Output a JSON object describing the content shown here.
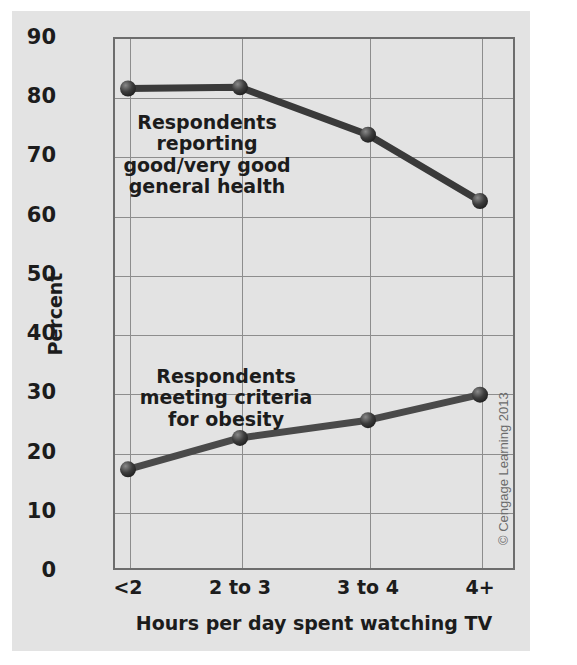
{
  "chart_data": {
    "type": "line",
    "title": "",
    "xlabel": "Hours per day spent watching TV",
    "ylabel": "Percent",
    "categories": [
      "<2",
      "2 to 3",
      "3 to 4",
      "4+"
    ],
    "ylim": [
      0,
      90
    ],
    "ytick_labels": [
      "0",
      "10",
      "20",
      "30",
      "40",
      "50",
      "60",
      "70",
      "80",
      "90"
    ],
    "ytick_values": [
      0,
      10,
      20,
      30,
      40,
      50,
      60,
      70,
      80,
      90
    ],
    "grid": true,
    "legend_position": "inline-annotations",
    "series": [
      {
        "name": "Respondents reporting good/very good general health",
        "values": [
          81.3,
          81.5,
          73.5,
          62.3
        ],
        "color": "#3a3a3a"
      },
      {
        "name": "Respondents meeting criteria for obesity",
        "values": [
          17.0,
          22.3,
          25.3,
          29.6
        ],
        "color": "#4a4a4a"
      }
    ],
    "annotations": [
      {
        "id": "health",
        "text": "Respondents reporting\ngood/very good\ngeneral health"
      },
      {
        "id": "obesity",
        "text": "Respondents\nmeeting criteria\nfor obesity"
      }
    ]
  },
  "credit": "© Cengage Learning 2013",
  "colors": {
    "panel_background": "#e3e3e3",
    "grid": "#8d8d8d",
    "axis": "#6d6d6d",
    "text": "#1c1c1c",
    "series_line": "#3a3a3a",
    "credit_text": "#6b6b6b"
  }
}
